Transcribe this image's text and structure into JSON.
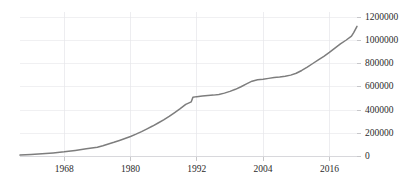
{
  "chart_data": {
    "type": "line",
    "title": "",
    "subtitle": "",
    "xlabel": "",
    "ylabel": "",
    "xlim": [
      1960,
      2021
    ],
    "ylim": [
      0,
      1200000
    ],
    "grid": true,
    "legend_position": "none",
    "line_color": "#7d7d7d",
    "x_ticks": [
      1968,
      1980,
      1992,
      2004,
      2016
    ],
    "x_tick_labels": [
      "1968",
      "1980",
      "1992",
      "2004",
      "2016"
    ],
    "y_ticks": [
      0,
      200000,
      400000,
      600000,
      800000,
      1000000,
      1200000
    ],
    "y_tick_labels": [
      "0",
      "200000",
      "400000",
      "600000",
      "800000",
      "1000000",
      "1200000"
    ],
    "series": [
      {
        "name": "cumulative total",
        "x": [
          1960,
          1962,
          1964,
          1966,
          1968,
          1970,
          1972,
          1974,
          1975,
          1976,
          1977,
          1978,
          1979,
          1980,
          1981,
          1982,
          1983,
          1984,
          1985,
          1986,
          1987,
          1988,
          1989,
          1990,
          1991,
          1991.3,
          1992,
          1993,
          1994,
          1995,
          1996,
          1997,
          1998,
          1999,
          2000,
          2001,
          2002,
          2003,
          2004,
          2005,
          2006,
          2007,
          2008,
          2009,
          2010,
          2011,
          2012,
          2013,
          2014,
          2015,
          2016,
          2017,
          2018,
          2019,
          2020,
          2020.4,
          2021
        ],
        "values": [
          12000,
          18000,
          24000,
          31000,
          40000,
          52000,
          66000,
          80000,
          92000,
          108000,
          122000,
          138000,
          155000,
          172000,
          192000,
          214000,
          238000,
          262000,
          288000,
          315000,
          345000,
          378000,
          412000,
          448000,
          470000,
          510000,
          515000,
          520000,
          525000,
          528000,
          534000,
          545000,
          560000,
          578000,
          600000,
          625000,
          648000,
          660000,
          665000,
          672000,
          680000,
          684000,
          690000,
          700000,
          716000,
          740000,
          768000,
          800000,
          832000,
          862000,
          895000,
          932000,
          968000,
          1000000,
          1035000,
          1065000,
          1120000
        ]
      }
    ]
  },
  "axis": {
    "y_axis_name": "y-axis",
    "x_axis_name": "x-axis"
  }
}
